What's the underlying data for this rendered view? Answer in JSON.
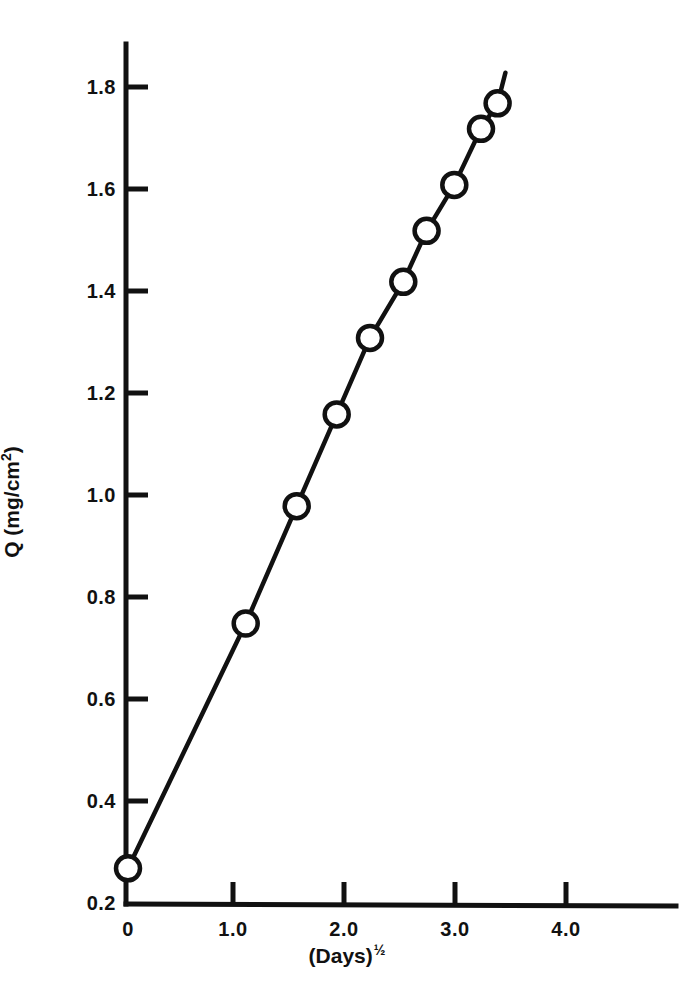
{
  "figure": {
    "background_color": "#ffffff",
    "ink_color": "#111111"
  },
  "chart_data": {
    "type": "scatter",
    "title": "",
    "subtitle": "",
    "xlabel": "(Days)½",
    "xlabel_base": "(Days)",
    "xlabel_exponent": "½",
    "ylabel": "Q (mg/cm2)",
    "ylabel_base": "Q (mg/cm",
    "ylabel_exponent": "2",
    "ylabel_suffix": ")",
    "xlim": [
      0,
      4.4
    ],
    "ylim": [
      0.2,
      1.86
    ],
    "grid": false,
    "legend": null,
    "marker": "open-circle",
    "line_style": "solid",
    "fit_line": {
      "description": "straight line through the points, extending past the last point",
      "x_start": 0,
      "y_start": 0.265,
      "x_end": 3.4,
      "y_end": 1.83
    },
    "xticks": [
      0,
      1.0,
      2.0,
      3.0,
      4.0
    ],
    "xtick_labels": [
      "0",
      "1.0",
      "2.0",
      "3.0",
      "4.0"
    ],
    "yticks": [
      0.2,
      0.4,
      0.6,
      0.8,
      1.0,
      1.2,
      1.4,
      1.6,
      1.8
    ],
    "ytick_labels": [
      "0.2",
      "0.4",
      "0.6",
      "0.8",
      "1.0",
      "1.2",
      "1.4",
      "1.6",
      "1.8"
    ],
    "x": [
      0.0,
      1.06,
      1.52,
      1.88,
      2.18,
      2.48,
      2.69,
      2.94,
      3.18,
      3.33
    ],
    "values": [
      0.27,
      0.75,
      0.98,
      1.16,
      1.31,
      1.42,
      1.52,
      1.61,
      1.72,
      1.77
    ],
    "points": [
      {
        "x": 0.0,
        "y": 0.27
      },
      {
        "x": 1.06,
        "y": 0.75
      },
      {
        "x": 1.52,
        "y": 0.98
      },
      {
        "x": 1.88,
        "y": 1.16
      },
      {
        "x": 2.18,
        "y": 1.31
      },
      {
        "x": 2.48,
        "y": 1.42
      },
      {
        "x": 2.69,
        "y": 1.52
      },
      {
        "x": 2.94,
        "y": 1.61
      },
      {
        "x": 3.18,
        "y": 1.72
      },
      {
        "x": 3.33,
        "y": 1.77
      }
    ]
  }
}
